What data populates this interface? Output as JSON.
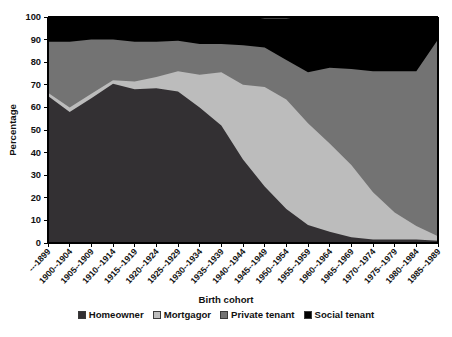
{
  "chart_data": {
    "type": "area",
    "stacked": true,
    "stack_total": 100,
    "title": "",
    "xlabel": "Birth cohort",
    "ylabel": "Percentage",
    "ylim": [
      0,
      100
    ],
    "ytick_step": 10,
    "yticks": [
      0,
      10,
      20,
      30,
      40,
      50,
      60,
      70,
      80,
      90,
      100
    ],
    "grid": false,
    "legend_position": "bottom",
    "categories": [
      "---1899",
      "1900--1904",
      "1905--1909",
      "1910--1914",
      "1915--1919",
      "1920--1924",
      "1925--1929",
      "1930--1934",
      "1935--1939",
      "1940--1944",
      "1945--1949",
      "1950--1954",
      "1955--1959",
      "1960--1964",
      "1965--1969",
      "1970--1974",
      "1975--1979",
      "1980--1984",
      "1985--1989"
    ],
    "series": [
      {
        "name": "Homeowner",
        "color": "#333033",
        "values": [
          65,
          58,
          64,
          70.5,
          68,
          68.5,
          67,
          60,
          52,
          37,
          25,
          15,
          8,
          5,
          2.5,
          1.5,
          1.5,
          1.5,
          1
        ]
      },
      {
        "name": "Mortgagor",
        "color": "#bcbcbc",
        "values": [
          1.5,
          2,
          2,
          1.5,
          3.5,
          5,
          9,
          14.5,
          23.5,
          33,
          44,
          48.5,
          45,
          39,
          32,
          21,
          12,
          6,
          2
        ]
      },
      {
        "name": "Private tenant",
        "color": "#737373",
        "values": [
          22.5,
          29,
          24,
          18,
          17.5,
          15.5,
          13.5,
          13.5,
          12.5,
          17.5,
          17.5,
          17.5,
          22.5,
          33.5,
          42.5,
          53.5,
          62.5,
          68.5,
          87
        ]
      },
      {
        "name": "Social tenant",
        "color": "#000000",
        "values": [
          11,
          11,
          10,
          10,
          11,
          11,
          10.5,
          12,
          12,
          12.5,
          13,
          18.5,
          24.5,
          22.5,
          23,
          24,
          24,
          24,
          10
        ]
      }
    ]
  },
  "legend": {
    "entries": [
      {
        "label": "Homeowner",
        "color": "#333033"
      },
      {
        "label": "Mortgagor",
        "color": "#bcbcbc"
      },
      {
        "label": "Private tenant",
        "color": "#737373"
      },
      {
        "label": "Social tenant",
        "color": "#000000"
      }
    ]
  },
  "axes": {
    "y_title": "Percentage",
    "x_title": "Birth cohort"
  }
}
